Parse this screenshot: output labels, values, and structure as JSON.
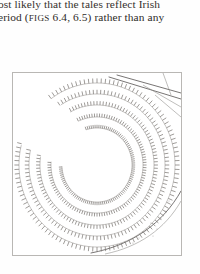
{
  "page": {
    "background_color": "#fefefe",
    "width": 200,
    "height": 274
  },
  "body_text": {
    "line_1": "ost likely that the tales reflect Irish",
    "line_2_prefix": "eriod (",
    "line_2_smallcaps": "FIGS",
    "line_2_suffix": " 6.4, 6.5) rather than any",
    "text_color": "#2e2b28"
  },
  "figure": {
    "caption": "",
    "frame": {
      "x": 12,
      "y": 72,
      "width": 170,
      "height": 184,
      "border_color": "#b9b7b4"
    },
    "ink_color": "#7e7a76",
    "line_color": "#555250",
    "ramparts": [
      {
        "name": "outer-rampart-1",
        "radius_x": 78,
        "radius_y": 82,
        "gap_start": 196,
        "gap_end": 232
      },
      {
        "name": "rampart-2",
        "radius_x": 68,
        "radius_y": 71,
        "gap_start": 193,
        "gap_end": 236
      },
      {
        "name": "rampart-3",
        "radius_x": 57,
        "radius_y": 60,
        "gap_start": 190,
        "gap_end": 240
      },
      {
        "name": "rampart-4",
        "radius_x": 46,
        "radius_y": 48,
        "gap_start": 186,
        "gap_end": 244
      },
      {
        "name": "inner-rampart-5",
        "radius_x": 35,
        "radius_y": 37,
        "gap_start": 180,
        "gap_end": 250
      }
    ],
    "centre": {
      "x": 84,
      "y": 92
    },
    "annotations": {
      "field_boundaries": "diagonal linear features upper right",
      "curved_boundary": "curving boundary lower right",
      "interior": "open unmarked enclosure centre"
    }
  }
}
